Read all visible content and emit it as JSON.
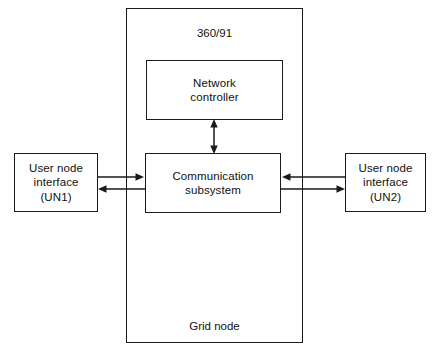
{
  "figure": {
    "type": "block-diagram",
    "width": 438,
    "height": 351,
    "background_color": "#ffffff",
    "line_color": "#1a1a1a",
    "text_color": "#111111"
  },
  "grid_node": {
    "title": "360/91",
    "footer": "Grid node",
    "name": "Grid node"
  },
  "blocks": {
    "network_controller": {
      "label": "Network\ncontroller"
    },
    "communication_subsystem": {
      "label": "Communication\nsubsystem"
    },
    "user_node_1": {
      "label": "User node\ninterface\n(UN1)"
    },
    "user_node_2": {
      "label": "User node\ninterface\n(UN2)"
    }
  },
  "connections": [
    {
      "id": "nc-cs",
      "from": "network_controller",
      "to": "communication_subsystem",
      "direction": "bidirectional",
      "orientation": "vertical"
    },
    {
      "id": "un1-to-cs",
      "from": "user_node_1",
      "to": "communication_subsystem",
      "direction": "forward",
      "orientation": "horizontal"
    },
    {
      "id": "cs-to-un1",
      "from": "communication_subsystem",
      "to": "user_node_1",
      "direction": "forward",
      "orientation": "horizontal"
    },
    {
      "id": "un2-to-cs",
      "from": "user_node_2",
      "to": "communication_subsystem",
      "direction": "forward",
      "orientation": "horizontal"
    },
    {
      "id": "cs-to-un2",
      "from": "communication_subsystem",
      "to": "user_node_2",
      "direction": "forward",
      "orientation": "horizontal"
    }
  ]
}
